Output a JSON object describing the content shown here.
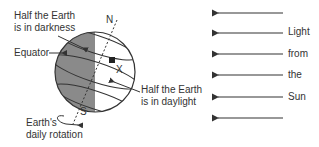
{
  "diagram": {
    "labels": {
      "darkness": [
        "Half the Earth",
        "is in darkness"
      ],
      "equator": "Equator",
      "north": "N",
      "south": "S",
      "point": "X",
      "daylight": [
        "Half the Earth",
        "is in daylight"
      ],
      "rotation": [
        "Earth's",
        "daily rotation"
      ]
    },
    "sunlight_words": [
      "Light",
      "from",
      "the",
      "Sun"
    ],
    "sunlight_arrow_count": 6,
    "colors": {
      "dark_side": "#8a8a8a",
      "light_side": "#ffffff",
      "lines": "#333333"
    }
  }
}
